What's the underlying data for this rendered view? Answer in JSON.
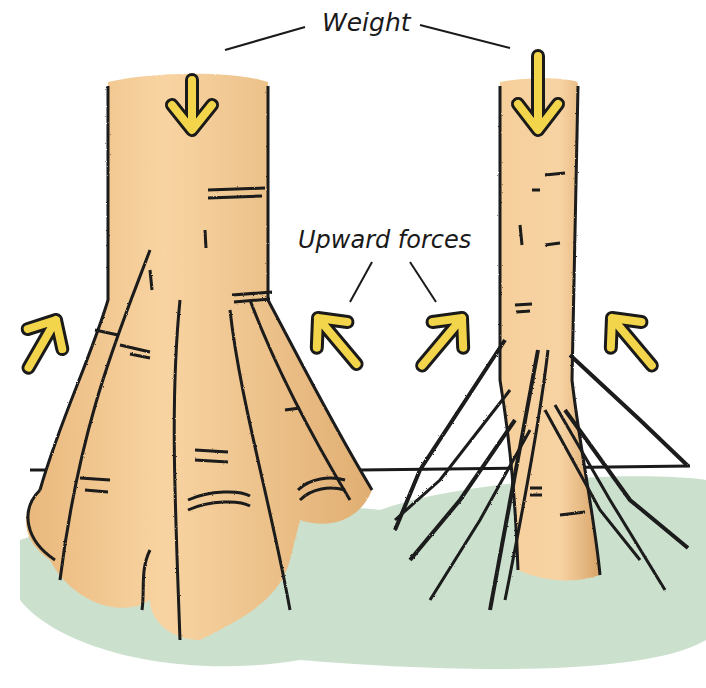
{
  "diagram": {
    "labels": {
      "weight": "Weight",
      "upward_forces": "Upward forces"
    },
    "colors": {
      "trunk": "#f6cc95",
      "trunk_shadow": "#d9a66a",
      "ground": "#b9d6bc",
      "arrow_fill": "#f2d54a",
      "outline": "#1a1a1a"
    },
    "trees": [
      {
        "id": "buttress-tree",
        "description": "Wide trunk with buttress roots"
      },
      {
        "id": "stilt-tree",
        "description": "Narrow trunk with stilt/prop roots"
      }
    ],
    "arrows": [
      {
        "id": "weight-left",
        "direction": "down"
      },
      {
        "id": "weight-right",
        "direction": "down"
      },
      {
        "id": "upward-far-left",
        "direction": "up-right"
      },
      {
        "id": "upward-mid-left",
        "direction": "up-left"
      },
      {
        "id": "upward-mid-right",
        "direction": "up-right"
      },
      {
        "id": "upward-far-right",
        "direction": "up-left"
      }
    ]
  }
}
